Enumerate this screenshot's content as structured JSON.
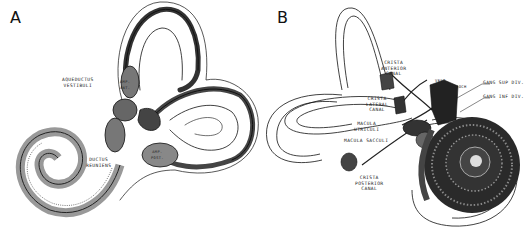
{
  "figure": {
    "panels": [
      {
        "id": "A",
        "letter": "A",
        "labels": {
          "aqueductus_vestibuli": "AQUEDUCTUS\nVESTIBULI",
          "amp_ant": "AMP.\nANT.",
          "amp_post": "AMP.\nPOST.",
          "ductus_reuniens": "DUCTUS\nREUNIENS"
        }
      },
      {
        "id": "B",
        "letter": "B",
        "labels": {
          "crista_anterior_canal": "CRISTA\nANTERIOR\nCANAL",
          "crista_lateral_canal": "CRISTA\nLATERAL\nCANAL",
          "macula_utriculi": "MACULA\nUTRICULI",
          "macula_sacculi": "MACULA SACCULI",
          "crista_posterior_canal": "CRISTA\nPOSTERIOR\nCANAL",
          "vest": "VEST",
          "coch": "COCH",
          "gang_sup_div": "GANG SUP DIV.",
          "gang_inf_div": "GANG INF DIV."
        }
      }
    ],
    "colors": {
      "ink": "#111111",
      "background": "#ffffff",
      "shade": "#555555"
    }
  }
}
